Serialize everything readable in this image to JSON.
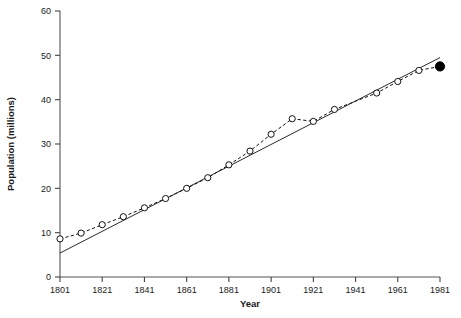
{
  "chart_data": {
    "type": "line",
    "title": "",
    "subtitle": "",
    "xlabel": "Year",
    "ylabel": "Population (millions)",
    "xlim": [
      1801,
      1981
    ],
    "ylim": [
      0,
      60
    ],
    "xticks": [
      1801,
      1821,
      1841,
      1861,
      1881,
      1901,
      1921,
      1941,
      1961,
      1981
    ],
    "yticks": [
      0,
      10,
      20,
      30,
      40,
      50,
      60
    ],
    "xtick_labels": [
      "1801",
      "1821",
      "1841",
      "1861",
      "1881",
      "1901",
      "1921",
      "1941",
      "1961",
      "1981"
    ],
    "ytick_labels": [
      "0",
      "10",
      "20",
      "30",
      "40",
      "50",
      "60"
    ],
    "grid": false,
    "legend": null,
    "legend_position": "none",
    "series": [
      {
        "name": "Census population",
        "marker": "open-circle",
        "line_style": "dashed",
        "x": [
          1801,
          1811,
          1821,
          1831,
          1841,
          1851,
          1861,
          1871,
          1881,
          1891,
          1901,
          1911,
          1921,
          1931,
          1951,
          1961,
          1971
        ],
        "values": [
          8.6,
          9.9,
          11.8,
          13.6,
          15.6,
          17.7,
          20.0,
          22.4,
          25.3,
          28.4,
          32.2,
          35.7,
          35.1,
          37.8,
          41.5,
          44.1,
          46.6
        ]
      },
      {
        "name": "Latest estimate",
        "marker": "filled-circle",
        "line_style": "none",
        "x": [
          1981
        ],
        "values": [
          47.5
        ]
      },
      {
        "name": "Linear trend",
        "marker": "none",
        "line_style": "solid",
        "x": [
          1801,
          1981
        ],
        "values": [
          5.4,
          49.5
        ]
      }
    ],
    "annotations": [
      {
        "text": "1911 point lies above the trend line",
        "x": 1911,
        "y": 35.7
      },
      {
        "text": "1921 point dips below the trend line",
        "x": 1921,
        "y": 35.1
      }
    ]
  },
  "axes": {
    "x_axis_name": "Year",
    "y_axis_name": "Population (millions)"
  }
}
